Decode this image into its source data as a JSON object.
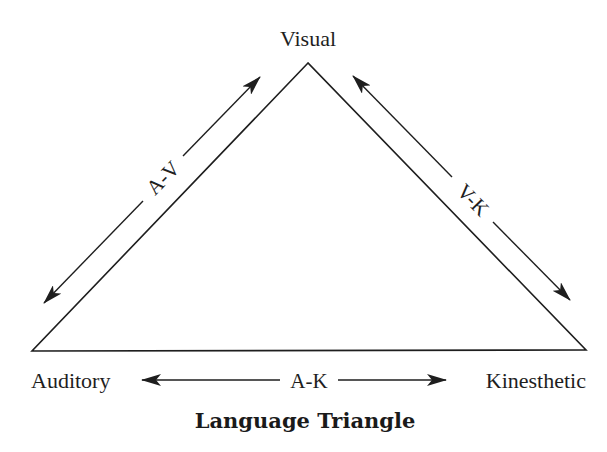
{
  "diagram": {
    "title": "Language Triangle",
    "nodes": {
      "top": "Visual",
      "left": "Auditory",
      "right": "Kinesthetic"
    },
    "edges": {
      "left": "A-V",
      "right": "V-K",
      "bottom": "A-K"
    },
    "colors": {
      "line": "#1e1e1e",
      "background": "#ffffff"
    }
  }
}
